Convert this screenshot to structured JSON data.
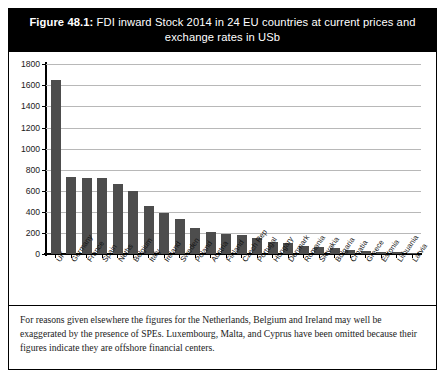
{
  "figure": {
    "number_label": "Figure 48.1:",
    "title_text": " FDI inward Stock 2014 in 24 EU countries at current prices and exchange rates in USb",
    "caption": "For reasons given elsewhere the figures for the Netherlands, Belgium and Ireland may well be exaggerated by the presence of SPEs. Luxembourg, Malta, and Cyprus have been omitted because their figures indicate they are offshore financial centers.",
    "banner_background": "#000000",
    "banner_text_color": "#ffffff",
    "bar_color": "#4d4d4d",
    "gridline_color": "#b8b8b8",
    "axis_color": "#000000"
  },
  "chart_data": {
    "type": "bar",
    "title": "Figure 48.1: FDI inward Stock 2014 in 24 EU countries at current prices and exchange rates in USb",
    "xlabel": "",
    "ylabel": "",
    "ylim": [
      0,
      1800
    ],
    "yticks": [
      0,
      200,
      400,
      600,
      800,
      1000,
      1200,
      1400,
      1600,
      1800
    ],
    "ytick_labels": [
      "0",
      "200",
      "400",
      "600",
      "800",
      "1000",
      "1200",
      "1400",
      "1600",
      "1800"
    ],
    "grid": true,
    "legend": false,
    "units": "USb",
    "categories": [
      "UK",
      "Germany",
      "France",
      "Spain",
      "Neths",
      "Belgium",
      "Italy",
      "Ireland",
      "Sweden",
      "Poland",
      "Austria",
      "Finland",
      "Czech Rep",
      "Portugal",
      "Hungary",
      "Denmark",
      "Romania",
      "Slovakia",
      "Bulgaria",
      "Croatia",
      "Greece",
      "Estonia",
      "Lithuania",
      "Latvia"
    ],
    "values": [
      1650,
      730,
      725,
      720,
      670,
      600,
      455,
      395,
      330,
      245,
      215,
      195,
      180,
      155,
      120,
      105,
      80,
      70,
      60,
      40,
      30,
      25,
      20,
      15
    ]
  }
}
